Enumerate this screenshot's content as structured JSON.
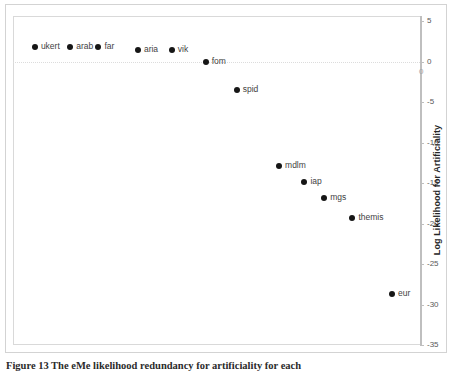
{
  "figure": {
    "caption": "Figure 13 The eMe likelihood redundancy for artificiality for each"
  },
  "chart_data": {
    "type": "scatter",
    "title": "",
    "xlabel": "",
    "ylabel": "Log Likelihood for Artificiality",
    "ylim": [
      -35,
      5
    ],
    "xlim": [
      0,
      13
    ],
    "grid": false,
    "zero_gridline": true,
    "legend": "none",
    "axis_position": "right",
    "y_ticks": [
      5,
      0,
      -5,
      -10,
      -15,
      -20,
      -25,
      -30,
      -35
    ],
    "y_tick_labels": [
      "5",
      "0",
      "-5",
      "-10",
      "-15",
      "-20",
      "-25",
      "-30",
      "-35"
    ],
    "origin_label": "0",
    "point_color": "#161616",
    "labels": [
      "ukert",
      "arab",
      "far",
      "aria",
      "vik",
      "fom",
      "spid",
      "mdlm",
      "iap",
      "mgs",
      "themis",
      "eur"
    ],
    "x": [
      0.35,
      1.6,
      2.6,
      4.0,
      5.2,
      6.4,
      7.5,
      9.0,
      9.9,
      10.6,
      11.6,
      13.0
    ],
    "y": [
      1.8,
      1.8,
      1.8,
      1.4,
      1.4,
      0.0,
      -3.5,
      -12.9,
      -14.9,
      -16.9,
      -19.3,
      -28.7
    ],
    "points": [
      {
        "label": "ukert",
        "x": 0.35,
        "y": 1.8
      },
      {
        "label": "arab",
        "x": 1.6,
        "y": 1.8
      },
      {
        "label": "far",
        "x": 2.6,
        "y": 1.8
      },
      {
        "label": "aria",
        "x": 4.0,
        "y": 1.4
      },
      {
        "label": "vik",
        "x": 5.2,
        "y": 1.4
      },
      {
        "label": "fom",
        "x": 6.4,
        "y": 0.0
      },
      {
        "label": "spid",
        "x": 7.5,
        "y": -3.5
      },
      {
        "label": "mdlm",
        "x": 9.0,
        "y": -12.9
      },
      {
        "label": "iap",
        "x": 9.9,
        "y": -14.9
      },
      {
        "label": "mgs",
        "x": 10.6,
        "y": -16.9
      },
      {
        "label": "themis",
        "x": 11.6,
        "y": -19.3
      },
      {
        "label": "eur",
        "x": 13.0,
        "y": -28.7
      }
    ]
  }
}
